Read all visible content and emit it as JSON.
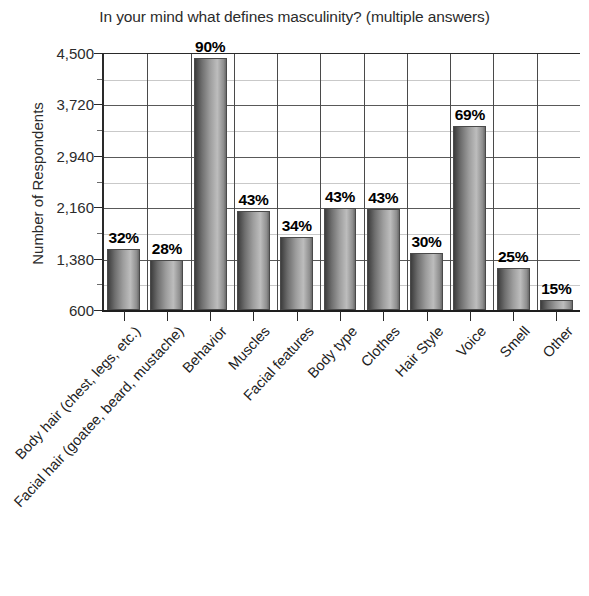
{
  "chart_data": {
    "type": "bar",
    "title": "In your mind what defines masculinity? (multiple answers)",
    "xlabel": "",
    "ylabel": "Number of Respondents",
    "ylim": [
      600,
      4500
    ],
    "ytick_labels": [
      "600",
      "1,380",
      "2,160",
      "2,940",
      "3,720",
      "4,500"
    ],
    "ytick_values": [
      600,
      1380,
      2160,
      2940,
      3720,
      4500
    ],
    "grid": "horizontal-and-vertical",
    "legend": "none",
    "categories": [
      "Body hair (chest, legs, etc.)",
      "Facial hair (goatee, beard, mustache)",
      "Behavior",
      "Muscles",
      "Facial features",
      "Body type",
      "Clothes",
      "Hair Style",
      "Voice",
      "Smell",
      "Other"
    ],
    "data_labels": [
      "32%",
      "28%",
      "90%",
      "43%",
      "34%",
      "43%",
      "43%",
      "30%",
      "69%",
      "25%",
      "15%"
    ],
    "percent_values": [
      32,
      28,
      90,
      43,
      34,
      43,
      43,
      30,
      69,
      25,
      15
    ],
    "values": [
      1520,
      1360,
      4420,
      2100,
      1710,
      2150,
      2130,
      1460,
      3390,
      1230,
      750
    ]
  },
  "colors": {
    "axis": "#1e1e1e",
    "gridline_major": "#595959",
    "gridline_minor": "#c9c9c9",
    "bar_dark": "#3d3d3d",
    "bar_light": "#bdbdbd",
    "text": "#222222",
    "background": "#ffffff"
  }
}
